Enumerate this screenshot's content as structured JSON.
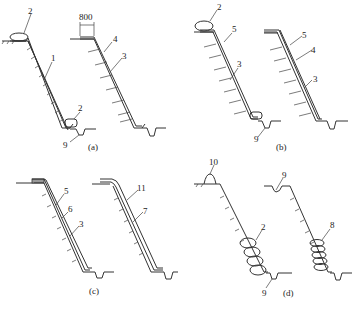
{
  "figure": {
    "panels": [
      {
        "id": "a",
        "caption": "(a)",
        "labels": [
          "2",
          "1",
          "2",
          "9",
          "800",
          "4",
          "3"
        ]
      },
      {
        "id": "b",
        "caption": "(b)",
        "labels": [
          "2",
          "5",
          "3",
          "9",
          "5",
          "4",
          "3"
        ]
      },
      {
        "id": "c",
        "caption": "(c)",
        "labels": [
          "5",
          "6",
          "3",
          "11",
          "7"
        ]
      },
      {
        "id": "d",
        "caption": "(d)",
        "labels": [
          "10",
          "2",
          "9",
          "9",
          "8"
        ]
      }
    ],
    "dimension": "800"
  },
  "a": {
    "cap": "(a)",
    "l2top": "2",
    "l1": "1",
    "l2bot": "2",
    "l9": "9",
    "dim": "800",
    "l4": "4",
    "l3": "3"
  },
  "b": {
    "cap": "(b)",
    "l2": "2",
    "l5": "5",
    "l3": "3",
    "l9": "9",
    "l5r": "5",
    "l4r": "4",
    "l3r": "3"
  },
  "c": {
    "cap": "(c)",
    "l5": "5",
    "l6": "6",
    "l3": "3",
    "l11": "11",
    "l7": "7"
  },
  "d": {
    "cap": "(d)",
    "l10": "10",
    "l2": "2",
    "l9": "9",
    "l9r": "9",
    "l8": "8"
  }
}
